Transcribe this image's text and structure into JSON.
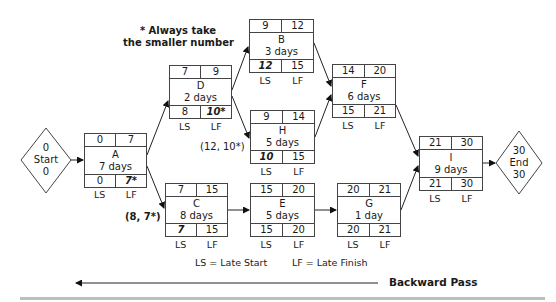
{
  "note": {
    "line1": "* Always take",
    "line2": "the smaller number"
  },
  "start": {
    "top": "0",
    "label": "Start",
    "bottom": "0"
  },
  "end": {
    "top": "30",
    "label": "End",
    "bottom": "30"
  },
  "nodes": {
    "A": {
      "name": "A",
      "duration": "7 days",
      "es": "0",
      "ef": "7",
      "ls": "0",
      "lf": "7*"
    },
    "D": {
      "name": "D",
      "duration": "2 days",
      "es": "7",
      "ef": "9",
      "ls": "8",
      "lf": "10*"
    },
    "B": {
      "name": "B",
      "duration": "3 days",
      "es": "9",
      "ef": "12",
      "ls": "12",
      "lf": "15"
    },
    "H": {
      "name": "H",
      "duration": "5 days",
      "es": "9",
      "ef": "14",
      "ls": "10",
      "lf": "15"
    },
    "F": {
      "name": "F",
      "duration": "6 days",
      "es": "14",
      "ef": "20",
      "ls": "15",
      "lf": "21"
    },
    "C": {
      "name": "C",
      "duration": "8 days",
      "es": "7",
      "ef": "15",
      "ls": "7",
      "lf": "15"
    },
    "E": {
      "name": "E",
      "duration": "5 days",
      "es": "15",
      "ef": "20",
      "ls": "15",
      "lf": "20"
    },
    "G": {
      "name": "G",
      "duration": "1 day",
      "es": "20",
      "ef": "21",
      "ls": "20",
      "lf": "21"
    },
    "I": {
      "name": "I",
      "duration": "9 days",
      "es": "21",
      "ef": "30",
      "ls": "21",
      "lf": "30"
    }
  },
  "col_labels": {
    "ls": "LS",
    "lf": "LF"
  },
  "annotations": {
    "h_choice": "(12, 10*)",
    "c_choice": "(8, 7*)"
  },
  "legend": {
    "ls": "LS = Late Start",
    "lf": "LF = Late Finish"
  },
  "direction": {
    "label": "Backward Pass"
  }
}
